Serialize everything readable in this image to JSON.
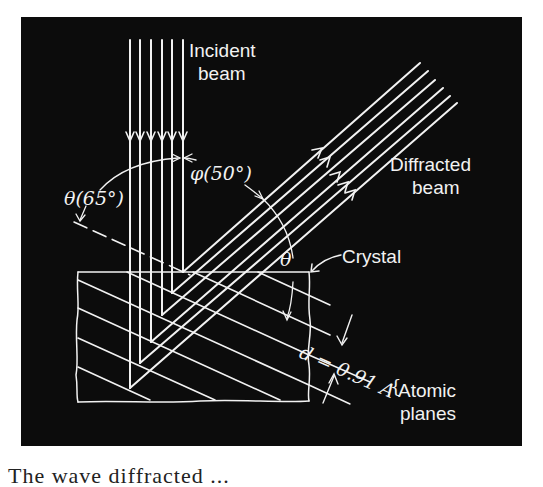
{
  "figure": {
    "labels": {
      "incident_1": "Incident",
      "incident_2": "beam",
      "diffracted_1": "Diffracted",
      "diffracted_2": "beam",
      "crystal": "Crystal",
      "atomic_1": "Atomic",
      "atomic_2": "planes",
      "theta_angle": "θ(65°)",
      "phi_angle": "φ(50°)",
      "theta": "θ",
      "spacing": "d = 0.91 A"
    },
    "values": {
      "theta_deg": 65,
      "phi_deg": 50,
      "d_spacing_angstrom": 0.91
    },
    "colors": {
      "background": "#0c0c0c",
      "lines": "#f2f2f2"
    }
  },
  "caption": {
    "text": "The wave diffracted ..."
  }
}
